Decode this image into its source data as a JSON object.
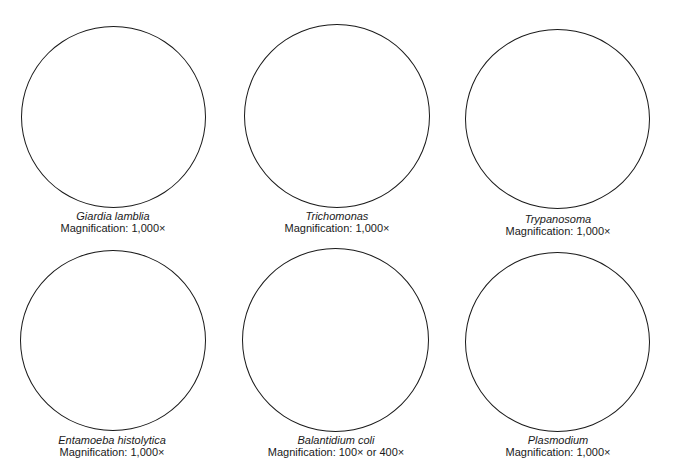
{
  "specimens": [
    {
      "name": "Giardia lamblia",
      "magnification": "Magnification: 1,000×"
    },
    {
      "name": "Trichomonas",
      "magnification": "Magnification: 1,000×"
    },
    {
      "name": "Trypanosoma",
      "magnification": "Magnification: 1,000×"
    },
    {
      "name": "Entamoeba histolytica",
      "magnification": "Magnification: 1,000×"
    },
    {
      "name": "Balantidium coli",
      "magnification": "Magnification: 100× or 400×"
    },
    {
      "name": "Plasmodium",
      "magnification": "Magnification: 1,000×"
    }
  ]
}
